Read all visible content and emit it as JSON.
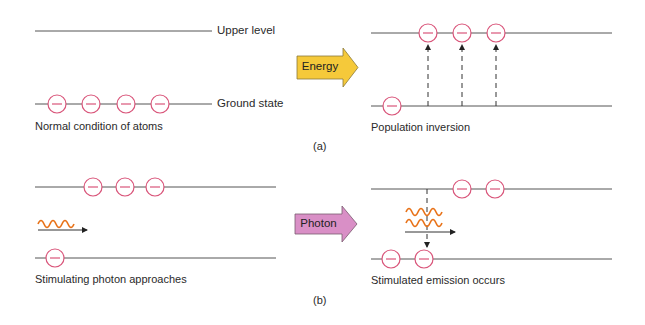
{
  "colors": {
    "line": "#555555",
    "electron": "#d9557a",
    "energy_arrow": "#f5c93a",
    "photon_arrow": "#d98fc6",
    "wave": "#e8731a"
  },
  "panel_a": {
    "left": {
      "upper_label": "Upper level",
      "ground_label": "Ground state",
      "caption": "Normal condition of atoms",
      "upper_electrons": 0,
      "ground_electrons": 4
    },
    "arrow_label": "Energy",
    "right": {
      "caption": "Population inversion",
      "upper_electrons": 3,
      "ground_electrons": 1,
      "excitation_arrows": 3
    },
    "label": "(a)"
  },
  "panel_b": {
    "left": {
      "caption": "Stimulating photon approaches",
      "upper_electrons": 3,
      "ground_electrons": 1,
      "photons": 1
    },
    "arrow_label": "Photon",
    "right": {
      "caption": "Stimulated emission occurs",
      "upper_electrons": 2,
      "ground_electrons": 2,
      "photons": 2
    },
    "label": "(b)"
  },
  "electron_symbol": "−"
}
